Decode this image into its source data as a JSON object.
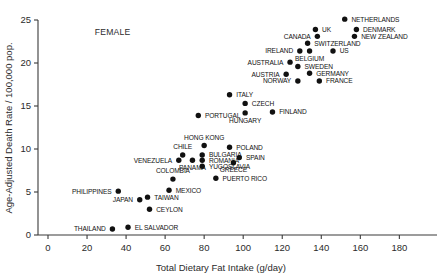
{
  "chart_data": {
    "type": "scatter",
    "title": "",
    "xlabel": "Total Dietary Fat Intake (g/day)",
    "ylabel": "Age-Adjusted Death Rate / 100,000 pop.",
    "xlim": [
      0,
      195
    ],
    "ylim": [
      0,
      25.8
    ],
    "xticks": [
      0,
      20,
      40,
      60,
      80,
      100,
      120,
      140,
      160,
      180
    ],
    "xticklabels": [
      "0",
      "20",
      "40",
      "60",
      "80",
      "100",
      "120",
      "140",
      "160",
      "180"
    ],
    "yticks": [
      0,
      5,
      10,
      15,
      20,
      25
    ],
    "yticklabels": [
      "0",
      "5",
      "10",
      "15",
      "20",
      "25"
    ],
    "grid": false,
    "legend": null,
    "annotations": [
      {
        "text": "FEMALE",
        "x": 24,
        "y": 23.2
      }
    ],
    "points": [
      {
        "label": "NETHERLANDS",
        "x": 152,
        "y": 25.1,
        "label_pos": "right"
      },
      {
        "label": "UK",
        "x": 137,
        "y": 23.9,
        "label_pos": "right"
      },
      {
        "label": "DENMARK",
        "x": 158,
        "y": 23.9,
        "label_pos": "right"
      },
      {
        "label": "CANADA",
        "x": 138,
        "y": 23.1,
        "label_pos": "left"
      },
      {
        "label": "NEW ZEALAND",
        "x": 157,
        "y": 23.1,
        "label_pos": "right"
      },
      {
        "label": "SWITZERLAND",
        "x": 133,
        "y": 22.3,
        "label_pos": "right"
      },
      {
        "label": "IRELAND",
        "x": 129,
        "y": 21.4,
        "label_pos": "left"
      },
      {
        "label": "BELGIUM",
        "x": 134,
        "y": 21.4,
        "label_pos": "below"
      },
      {
        "label": "US",
        "x": 146,
        "y": 21.4,
        "label_pos": "right"
      },
      {
        "label": "AUSTRALIA",
        "x": 124,
        "y": 20.1,
        "label_pos": "left"
      },
      {
        "label": "SWEDEN",
        "x": 128,
        "y": 19.6,
        "label_pos": "right"
      },
      {
        "label": "GERMANY",
        "x": 134,
        "y": 18.8,
        "label_pos": "right"
      },
      {
        "label": "AUSTRIA",
        "x": 122,
        "y": 18.7,
        "label_pos": "left"
      },
      {
        "label": "NORWAY",
        "x": 128,
        "y": 17.9,
        "label_pos": "left"
      },
      {
        "label": "FRANCE",
        "x": 139,
        "y": 17.9,
        "label_pos": "right"
      },
      {
        "label": "ITALY",
        "x": 93,
        "y": 16.3,
        "label_pos": "right"
      },
      {
        "label": "CZECH",
        "x": 101,
        "y": 15.3,
        "label_pos": "right"
      },
      {
        "label": "PORTUGAL",
        "x": 77,
        "y": 13.9,
        "label_pos": "right"
      },
      {
        "label": "HUNGARY",
        "x": 101,
        "y": 14.2,
        "label_pos": "below"
      },
      {
        "label": "FINLAND",
        "x": 115,
        "y": 14.3,
        "label_pos": "right"
      },
      {
        "label": "HONG KONG",
        "x": 80,
        "y": 10.4,
        "label_pos": "above"
      },
      {
        "label": "POLAND",
        "x": 93,
        "y": 10.2,
        "label_pos": "right"
      },
      {
        "label": "CHILE",
        "x": 69,
        "y": 9.3,
        "label_pos": "above"
      },
      {
        "label": "BULGARIA",
        "x": 79,
        "y": 9.3,
        "label_pos": "right"
      },
      {
        "label": "SPAIN",
        "x": 98,
        "y": 9.0,
        "label_pos": "right"
      },
      {
        "label": "VENEZUELA",
        "x": 67,
        "y": 8.7,
        "label_pos": "left"
      },
      {
        "label": "ROMANIA",
        "x": 79,
        "y": 8.7,
        "label_pos": "right"
      },
      {
        "label": "GREECE",
        "x": 95,
        "y": 8.4,
        "label_pos": "below"
      },
      {
        "label": "PANAMA",
        "x": 74,
        "y": 8.7,
        "label_pos": "below"
      },
      {
        "label": "YUGOSLAVIA",
        "x": 79,
        "y": 8.0,
        "label_pos": "right"
      },
      {
        "label": "PHILIPPINES",
        "x": 36,
        "y": 5.1,
        "label_pos": "left"
      },
      {
        "label": "COLOMBIA",
        "x": 64,
        "y": 6.5,
        "label_pos": "above"
      },
      {
        "label": "PUERTO RICO",
        "x": 86,
        "y": 6.6,
        "label_pos": "right"
      },
      {
        "label": "MEXICO",
        "x": 62,
        "y": 5.2,
        "label_pos": "right"
      },
      {
        "label": "JAPAN",
        "x": 47,
        "y": 4.1,
        "label_pos": "left"
      },
      {
        "label": "TAIWAN",
        "x": 51,
        "y": 4.4,
        "label_pos": "right"
      },
      {
        "label": "CEYLON",
        "x": 52,
        "y": 3.0,
        "label_pos": "right"
      },
      {
        "label": "THAILAND",
        "x": 33,
        "y": 0.7,
        "label_pos": "left"
      },
      {
        "label": "EL SALVADOR",
        "x": 41,
        "y": 0.9,
        "label_pos": "right"
      }
    ]
  }
}
